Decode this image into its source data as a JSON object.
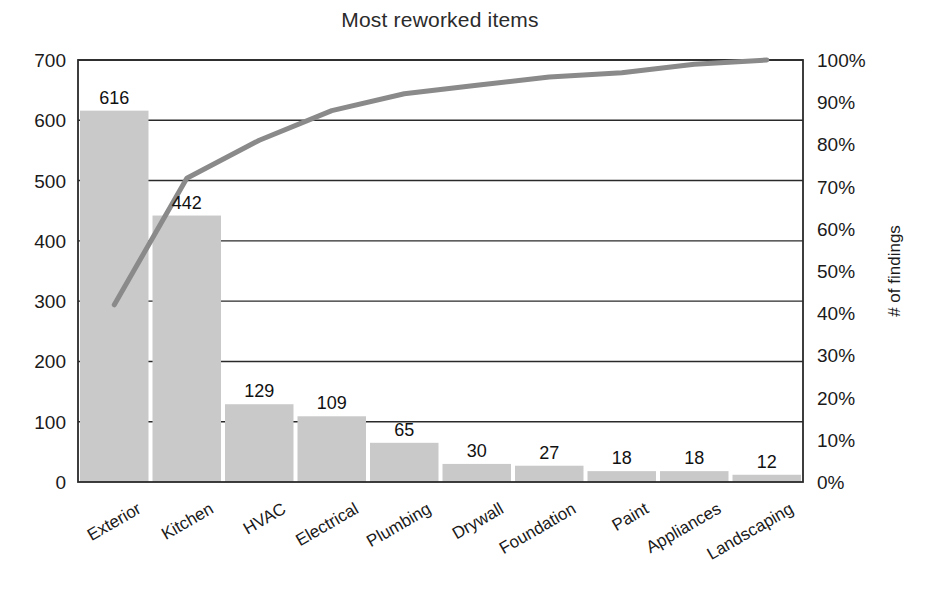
{
  "chart_data": {
    "type": "bar",
    "title": "Most reworked items",
    "xlabel": "",
    "ylabel": "",
    "ylabel_right": "# of findings",
    "categories": [
      "Exterior",
      "Kitchen",
      "HVAC",
      "Electrical",
      "Plumbing",
      "Drywall",
      "Foundation",
      "Paint",
      "Appliances",
      "Landscaping"
    ],
    "values": [
      616,
      442,
      129,
      109,
      65,
      30,
      27,
      18,
      18,
      12
    ],
    "value_labels": [
      "616",
      "442",
      "129",
      "109",
      "65",
      "30",
      "27",
      "18",
      "18",
      "12"
    ],
    "series": [
      {
        "name": "# of findings",
        "type": "bar",
        "axis": "left",
        "values": [
          616,
          442,
          129,
          109,
          65,
          30,
          27,
          18,
          18,
          12
        ]
      },
      {
        "name": "Cumulative %",
        "type": "line",
        "axis": "right",
        "values": [
          42,
          72,
          81,
          88,
          92,
          94,
          96,
          97,
          99,
          100
        ]
      }
    ],
    "ylim": [
      0,
      700
    ],
    "ylim_right": [
      0,
      100
    ],
    "ytick_labels": [
      "0",
      "100",
      "200",
      "300",
      "400",
      "500",
      "600",
      "700"
    ],
    "ytick_values": [
      0,
      100,
      200,
      300,
      400,
      500,
      600,
      700
    ],
    "ytick_labels_right": [
      "0%",
      "10%",
      "20%",
      "30%",
      "40%",
      "50%",
      "60%",
      "70%",
      "80%",
      "90%",
      "100%"
    ],
    "ytick_values_right": [
      0,
      10,
      20,
      30,
      40,
      50,
      60,
      70,
      80,
      90,
      100
    ],
    "grid": true,
    "legend": "none",
    "bar_color": "#c9c9c9",
    "line_color": "#8a8a8a",
    "axis_color": "#2a2a2a",
    "total": 1466
  }
}
